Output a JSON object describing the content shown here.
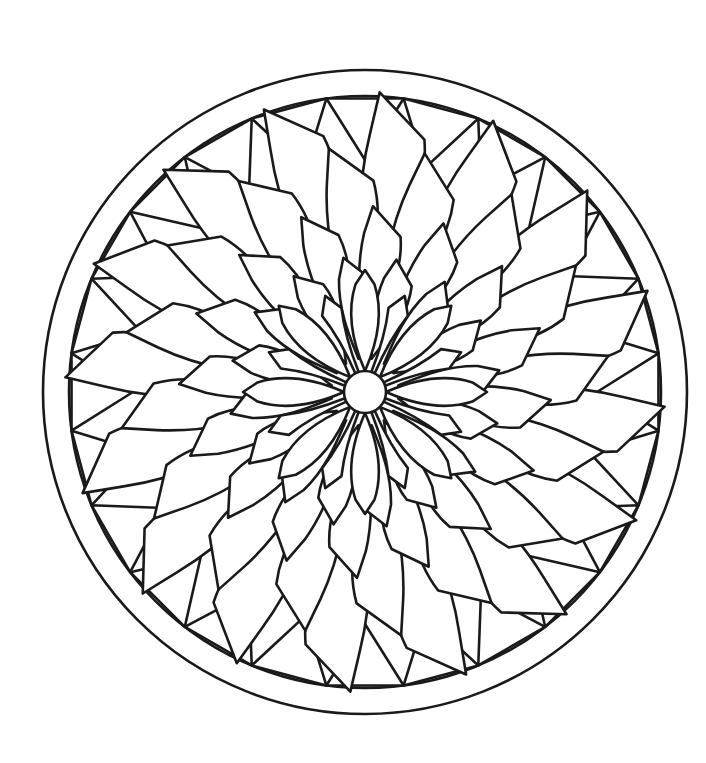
{
  "page": {
    "background_color": "#ffffff",
    "width": 706,
    "height": 763
  },
  "artwork": {
    "name": "mandala-flower",
    "style": "line-art-coloring-page",
    "line_color": "#1a1a1a",
    "fill_color": "#ffffff",
    "line_width": 2.6,
    "center_x": 365,
    "center_y": 392,
    "outer_radius": 322,
    "description": "Circular mandala with concentric rings of pointed leaf-shaped petals radiating from a small central circle, bordered by a ring of triangles inside two concentric circles."
  },
  "chart_data": {
    "type": "radial-mandala",
    "center": {
      "x": 365,
      "y": 392
    },
    "rings": [
      {
        "name": "outer-circle",
        "shape": "circle",
        "radius": 322,
        "count": 1
      },
      {
        "name": "inner-border-circle",
        "shape": "circle",
        "radius": 296,
        "count": 1
      },
      {
        "name": "border-triangle-ring",
        "shape": "triangle",
        "count": 24,
        "inner_radius": 232,
        "outer_radius": 296,
        "half_width_deg": 7.5,
        "rotation_offset_deg": 0
      },
      {
        "name": "petal-ring-1-outermost",
        "shape": "leaf-petal",
        "count": 16,
        "base_radius": 96,
        "tip_radius": 300,
        "belly": 0.5,
        "half_width_deg": 11,
        "rotation_offset_deg": 0,
        "tilt_deg": 8
      },
      {
        "name": "petal-ring-2",
        "shape": "leaf-petal",
        "count": 16,
        "base_radius": 74,
        "tip_radius": 246,
        "belly": 0.5,
        "half_width_deg": 11.5,
        "rotation_offset_deg": 11.25,
        "tilt_deg": 8
      },
      {
        "name": "petal-ring-3",
        "shape": "leaf-petal",
        "count": 16,
        "base_radius": 52,
        "tip_radius": 186,
        "belly": 0.5,
        "half_width_deg": 12,
        "rotation_offset_deg": 0,
        "tilt_deg": 7
      },
      {
        "name": "petal-ring-4",
        "shape": "leaf-petal",
        "count": 16,
        "base_radius": 34,
        "tip_radius": 136,
        "belly": 0.5,
        "half_width_deg": 13,
        "rotation_offset_deg": 11.25,
        "tilt_deg": 6
      },
      {
        "name": "petal-ring-5-inner-flower",
        "shape": "pointed-petal",
        "count": 8,
        "base_radius": 21,
        "tip_radius": 122,
        "belly": 0.52,
        "half_width_deg": 17,
        "rotation_offset_deg": 0
      },
      {
        "name": "petal-ring-6-inner-spokes",
        "shape": "narrow-spoke",
        "count": 8,
        "base_radius": 21,
        "tip_radius": 104,
        "half_width_deg": 5.5,
        "rotation_offset_deg": 22.5
      },
      {
        "name": "center-circle",
        "shape": "circle",
        "radius": 21,
        "count": 1
      }
    ],
    "palette": {
      "stroke": "#1a1a1a",
      "fill": "#ffffff",
      "page": "#ffffff"
    },
    "axis": {
      "grid": false,
      "legend": false,
      "labels": false
    }
  }
}
